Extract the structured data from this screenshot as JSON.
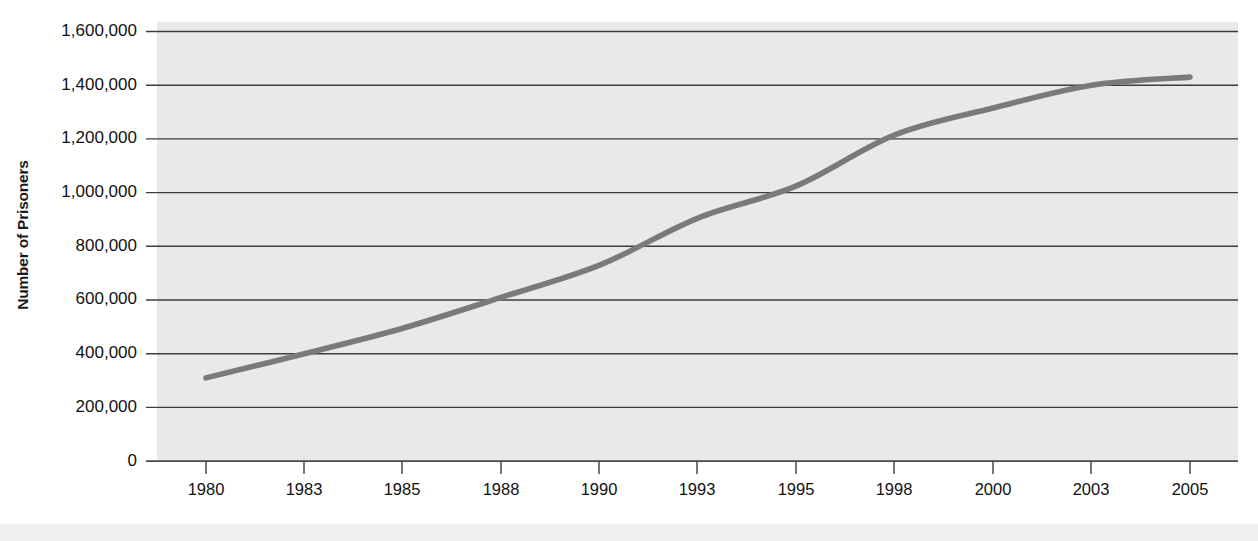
{
  "chart_data": {
    "type": "line",
    "title": "",
    "subtitle": "",
    "xlabel": "",
    "ylabel": "Number of Prisoners",
    "categories": [
      "1980",
      "1983",
      "1985",
      "1988",
      "1990",
      "1993",
      "1995",
      "1998",
      "2000",
      "2003",
      "2005"
    ],
    "values": [
      310000,
      400000,
      495000,
      610000,
      730000,
      905000,
      1025000,
      1215000,
      1315000,
      1400000,
      1430000
    ],
    "series": [
      {
        "name": "Number of Prisoners",
        "values": [
          310000,
          400000,
          495000,
          610000,
          730000,
          905000,
          1025000,
          1215000,
          1315000,
          1400000,
          1430000
        ]
      }
    ],
    "ylim": [
      0,
      1600000
    ],
    "ytick_labels": [
      "1,600,000",
      "1,400,000",
      "1,200,000",
      "1,000,000",
      "800,000",
      "600,000",
      "400,000",
      "200,000",
      "0"
    ],
    "ytick_values": [
      1600000,
      1400000,
      1200000,
      1000000,
      800000,
      600000,
      400000,
      200000,
      0
    ],
    "xtick_labels": [
      "1980",
      "1983",
      "1985",
      "1988",
      "1990",
      "1993",
      "1995",
      "1998",
      "2000",
      "2003",
      "2005"
    ],
    "grid": true,
    "grid_orientation": "horizontal",
    "legend": false,
    "legend_position": "none",
    "annotations": []
  },
  "style": {
    "plot_background": "#e9e9e9",
    "page_background": "#ffffff",
    "line_color": "#7a7a7a",
    "grid_color": "#3c3c3c",
    "axis_color": "#4a4a4a",
    "text_color": "#111111",
    "bottom_band_color": "#f0f0f0"
  },
  "labels": {
    "y_axis_title": "Number of Prisoners"
  }
}
